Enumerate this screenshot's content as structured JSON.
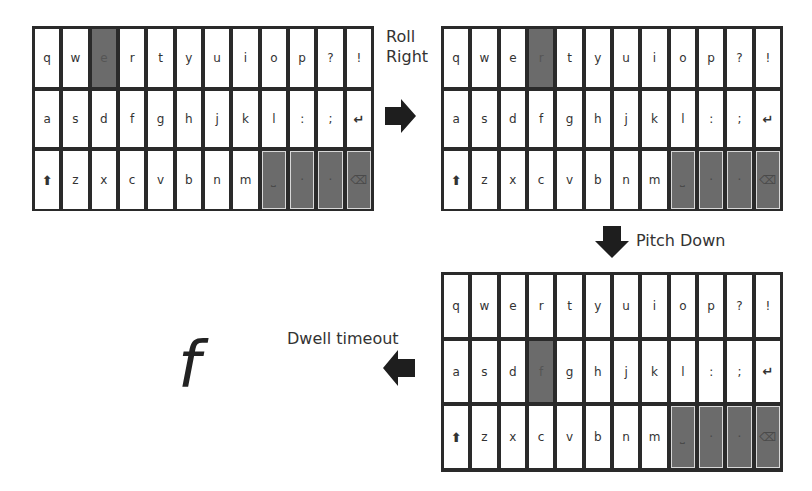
{
  "keyboard_layout": {
    "rows": [
      [
        "q",
        "w",
        "e",
        "r",
        "t",
        "y",
        "u",
        "i",
        "o",
        "p",
        "?",
        "!"
      ],
      [
        "a",
        "s",
        "d",
        "f",
        "g",
        "h",
        "j",
        "k",
        "l",
        ":",
        ";",
        "↵"
      ],
      [
        "⇧",
        "z",
        "x",
        "c",
        "v",
        "b",
        "n",
        "m",
        "␣",
        "·",
        "·",
        "⌫"
      ]
    ],
    "function_keys": [
      "space",
      "period",
      "comma",
      "backspace"
    ]
  },
  "panels": [
    {
      "id": "start",
      "highlighted_key": "e",
      "position": "top-left"
    },
    {
      "id": "after-roll",
      "highlighted_key": "r",
      "position": "top-right"
    },
    {
      "id": "after-pitch",
      "highlighted_key": "f",
      "position": "bottom-right"
    }
  ],
  "transitions": {
    "roll": {
      "label_line1": "Roll",
      "label_line2": "Right",
      "direction": "right"
    },
    "pitch": {
      "label": "Pitch Down",
      "direction": "down"
    },
    "dwell": {
      "label": "Dwell timeout",
      "direction": "left"
    }
  },
  "output_char": "f",
  "colors": {
    "frame": "#2a2a2a",
    "highlight": "#6b6b6b",
    "key": "#ffffff",
    "text": "#333333"
  }
}
